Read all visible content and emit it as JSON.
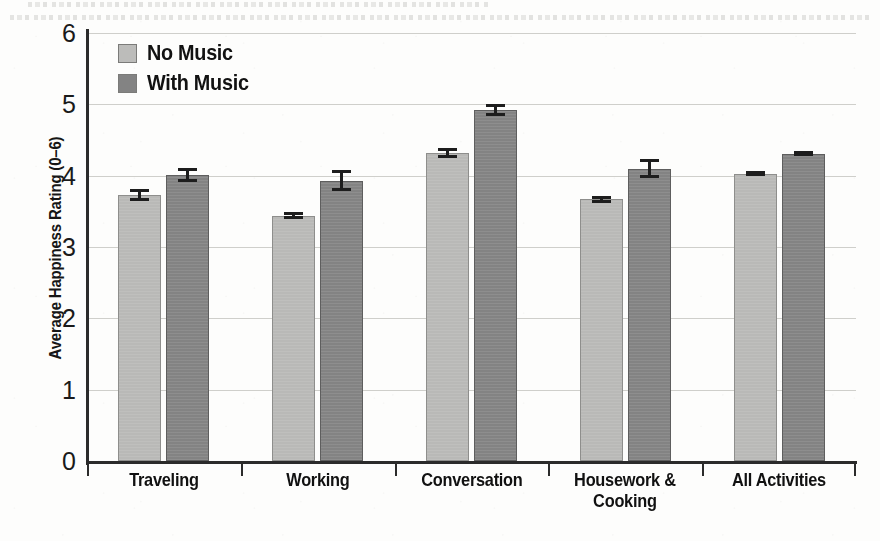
{
  "chart_data": {
    "type": "bar",
    "title": "",
    "subtitle": "",
    "xlabel": "",
    "ylabel": "Average Happiness Rating (0–6)",
    "ylim": [
      0,
      6
    ],
    "ytick_labels": [
      "0",
      "1",
      "2",
      "3",
      "4",
      "5",
      "6"
    ],
    "ytick_values": [
      0,
      1,
      2,
      3,
      4,
      5,
      6
    ],
    "grid": "horizontal",
    "legend_position": "top-left-inside",
    "categories": [
      "Traveling",
      "Working",
      "Conversation",
      "Housework & Cooking",
      "All Activities"
    ],
    "category_label_lines": [
      [
        "Traveling"
      ],
      [
        "Working"
      ],
      [
        "Conversation"
      ],
      [
        "Housework &",
        "Cooking"
      ],
      [
        "All Activities"
      ]
    ],
    "series": [
      {
        "name": "No Music",
        "color": "#b9b9b7",
        "values": [
          3.73,
          3.44,
          4.32,
          3.67,
          4.03
        ],
        "errors": [
          0.08,
          0.05,
          0.07,
          0.05,
          0.03
        ]
      },
      {
        "name": "With Music",
        "color": "#838383",
        "values": [
          4.01,
          3.93,
          4.92,
          4.1,
          4.31
        ],
        "errors": [
          0.1,
          0.15,
          0.08,
          0.13,
          0.04
        ]
      }
    ]
  },
  "legend": {
    "items": [
      {
        "label": "No Music",
        "swatch": "light"
      },
      {
        "label": "With Music",
        "swatch": "dark"
      }
    ]
  },
  "axes": {
    "y_title": "Average Happiness Rating (0–6)"
  }
}
